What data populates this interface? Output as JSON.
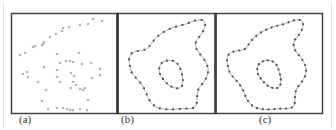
{
  "figure": {
    "panels": [
      {
        "id": "a",
        "label": "(a)",
        "content": "scattered input points"
      },
      {
        "id": "b",
        "label": "(b)",
        "content": "points with fitted closed curves"
      },
      {
        "id": "c",
        "label": "(c)",
        "content": "resampled points along fitted curves"
      }
    ],
    "colors": {
      "border": "#333333",
      "points_a": "#b8b8b8",
      "points_bc": "#555555",
      "curve": "#9a9a9a"
    }
  },
  "panel_a_points": [
    [
      93,
      19
    ],
    [
      102,
      21
    ],
    [
      88,
      24
    ],
    [
      80,
      25
    ],
    [
      69,
      27
    ],
    [
      63,
      28
    ],
    [
      62,
      31
    ],
    [
      56,
      34
    ],
    [
      50,
      37
    ],
    [
      44,
      42
    ],
    [
      43,
      44
    ],
    [
      42,
      45
    ],
    [
      35,
      46
    ],
    [
      33,
      47
    ],
    [
      25,
      53
    ],
    [
      20,
      55
    ],
    [
      57,
      54
    ],
    [
      66,
      61
    ],
    [
      70,
      61
    ],
    [
      73,
      62
    ],
    [
      82,
      64
    ],
    [
      79,
      53
    ],
    [
      91,
      63
    ],
    [
      100,
      69
    ],
    [
      100,
      75
    ],
    [
      92,
      78
    ],
    [
      85,
      88
    ],
    [
      83,
      90
    ],
    [
      80,
      89
    ],
    [
      76,
      85
    ],
    [
      73,
      82
    ],
    [
      71,
      88
    ],
    [
      60,
      82
    ],
    [
      57,
      77
    ],
    [
      57,
      70
    ],
    [
      71,
      73
    ],
    [
      74,
      76
    ],
    [
      60,
      63
    ],
    [
      44,
      67
    ],
    [
      28,
      77
    ],
    [
      23,
      74
    ],
    [
      38,
      82
    ],
    [
      27,
      72
    ],
    [
      46,
      90
    ],
    [
      42,
      101
    ],
    [
      88,
      100
    ],
    [
      87,
      110
    ],
    [
      80,
      109
    ],
    [
      73,
      110
    ],
    [
      70,
      110
    ],
    [
      67,
      109
    ],
    [
      63,
      108
    ],
    [
      57,
      108
    ],
    [
      48,
      109
    ]
  ]
}
